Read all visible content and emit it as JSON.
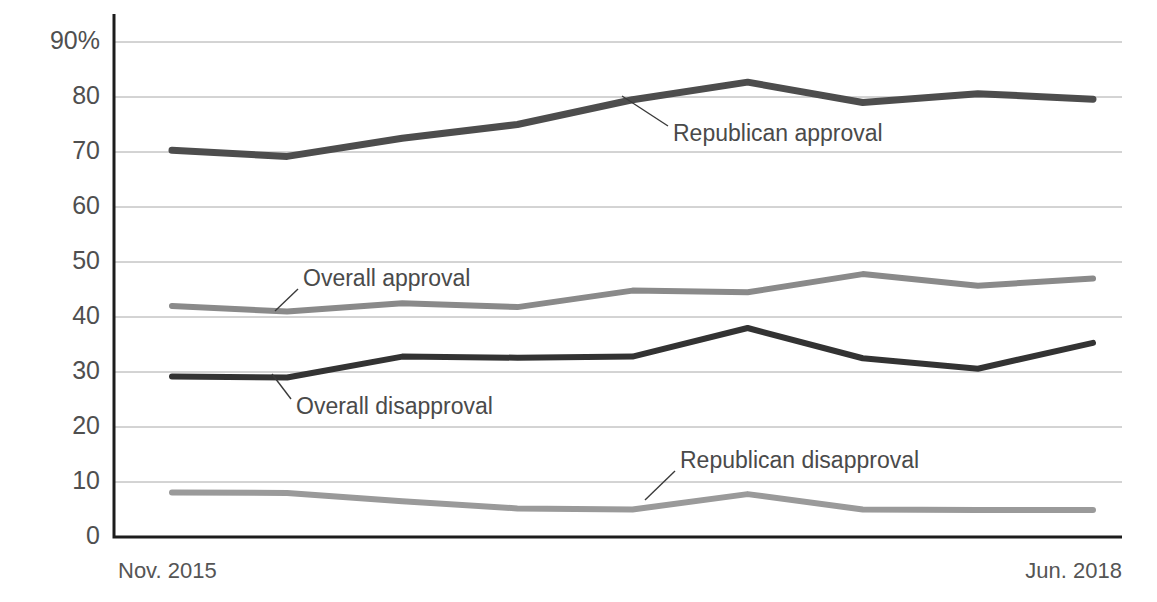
{
  "chart_data": {
    "type": "line",
    "title": "",
    "xlabel": "",
    "ylabel": "",
    "ylim": [
      0,
      95
    ],
    "yticks": [
      0,
      10,
      20,
      30,
      40,
      50,
      60,
      70,
      80,
      90
    ],
    "ytick_labels": [
      "0",
      "10",
      "20",
      "30",
      "40",
      "50",
      "60",
      "70",
      "80",
      "90%"
    ],
    "grid": "horizontal",
    "legend_position": "inline-annotations",
    "x_axis_start_label": "Nov. 2015",
    "x_axis_end_label": "Jun. 2018",
    "x": [
      0,
      1,
      2,
      3,
      4,
      5,
      6,
      7,
      8
    ],
    "series": [
      {
        "name": "Republican approval",
        "color": "#4d4d4d",
        "stroke_width": 7,
        "values": [
          70.3,
          69.2,
          72.5,
          75.0,
          79.5,
          82.7,
          79.0,
          80.6,
          79.6
        ]
      },
      {
        "name": "Overall approval",
        "color": "#8a8a8a",
        "stroke_width": 6,
        "values": [
          42.0,
          41.0,
          42.5,
          41.8,
          44.8,
          44.5,
          47.8,
          45.7,
          47.0
        ]
      },
      {
        "name": "Overall disapproval",
        "color": "#333333",
        "stroke_width": 6,
        "values": [
          29.2,
          29.0,
          32.8,
          32.6,
          32.8,
          38.0,
          32.5,
          30.6,
          35.3
        ]
      },
      {
        "name": "Republican disapproval",
        "color": "#9a9a9a",
        "stroke_width": 6,
        "values": [
          8.1,
          8.0,
          6.5,
          5.2,
          5.0,
          7.8,
          5.0,
          4.9,
          4.9
        ]
      }
    ],
    "annotations": [
      {
        "text": "Republican approval",
        "label_x": 673,
        "label_y": 135,
        "leader_from_x": 668,
        "leader_from_y": 126,
        "leader_to_x": 622,
        "leader_to_y": 96
      },
      {
        "text": "Overall approval",
        "label_x": 303,
        "label_y": 280,
        "leader_from_x": 298,
        "leader_from_y": 289,
        "leader_to_x": 275,
        "leader_to_y": 311
      },
      {
        "text": "Overall disapproval",
        "label_x": 296,
        "label_y": 408,
        "leader_from_x": 291,
        "leader_from_y": 399,
        "leader_to_x": 272,
        "leader_to_y": 374
      },
      {
        "text": "Republican disapproval",
        "label_x": 680,
        "label_y": 462,
        "leader_from_x": 675,
        "leader_from_y": 471,
        "leader_to_x": 645,
        "leader_to_y": 500
      }
    ]
  },
  "axis": {
    "left_labels": [
      "90%",
      "80",
      "70",
      "60",
      "50",
      "40",
      "30",
      "20",
      "10",
      "0"
    ],
    "bottom_left": "Nov. 2015",
    "bottom_right": "Jun. 2018"
  }
}
